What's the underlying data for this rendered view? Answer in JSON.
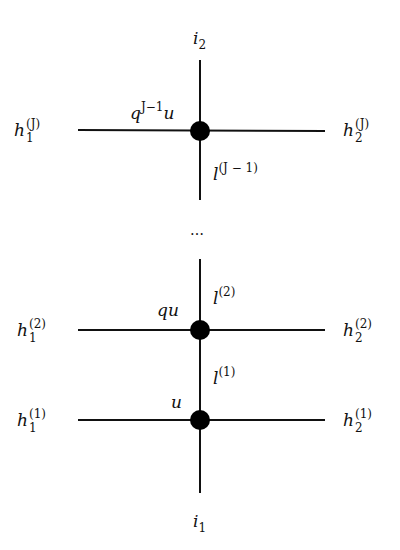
{
  "diagram": {
    "type": "lattice-vertex-chain",
    "vertical_top_label": {
      "base": "i",
      "sub": "2"
    },
    "vertical_bottom_label": {
      "base": "i",
      "sub": "1"
    },
    "ellipsis": "…",
    "nodes": [
      {
        "id": "node-J",
        "spectral_parameter": {
          "base": "q",
          "sup": "J−1",
          "tail": "u"
        },
        "left_label": {
          "base": "h",
          "sub": "1",
          "sup": "(J)"
        },
        "right_label": {
          "base": "h",
          "sub": "2",
          "sup": "(J)"
        },
        "below_label": {
          "base": "l",
          "sup": "(J − 1)"
        }
      },
      {
        "id": "node-2",
        "spectral_parameter": {
          "base": "qu"
        },
        "left_label": {
          "base": "h",
          "sub": "1",
          "sup": "(2)"
        },
        "right_label": {
          "base": "h",
          "sub": "2",
          "sup": "(2)"
        },
        "above_label": {
          "base": "l",
          "sup": "(2)"
        }
      },
      {
        "id": "node-1",
        "spectral_parameter": {
          "base": "u"
        },
        "left_label": {
          "base": "h",
          "sub": "1",
          "sup": "(1)"
        },
        "right_label": {
          "base": "h",
          "sub": "2",
          "sup": "(1)"
        },
        "above_label": {
          "base": "l",
          "sup": "(1)"
        }
      }
    ],
    "colors": {
      "line": "#111111",
      "node": "#000000",
      "background": "#ffffff"
    }
  }
}
